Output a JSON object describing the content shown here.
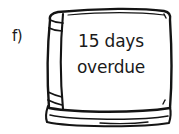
{
  "figure": {
    "item_label": "f)",
    "caption_lines": [
      "15 days",
      "overdue"
    ],
    "object_icon_name": "closed-book-icon",
    "style": "hand-drawn-ink-sketch",
    "colors": {
      "ink": "#141414",
      "paper": "#ffffff",
      "text": "#1a1a1a"
    }
  }
}
